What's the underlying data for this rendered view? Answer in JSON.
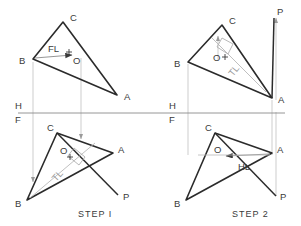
{
  "drawing": {
    "title": "Perpendicular to a Plane - Two Step Construction",
    "colors": {
      "object_line": "#2b2b2b",
      "construction_line": "#b0b0b0",
      "fold_line": "#8a8a8a",
      "label_text": "#3a3a3a",
      "tl_text": "#9a9a9a",
      "background": "#ffffff"
    },
    "fold_line": {
      "upper_label": "H",
      "lower_label": "F",
      "y": 113,
      "x_start": 18,
      "x_end": 285
    },
    "step_labels": [
      {
        "text": "STEP I",
        "x": 78,
        "y": 214
      },
      {
        "text": "STEP 2",
        "x": 232,
        "y": 214
      }
    ],
    "views": [
      {
        "id": "step1-top",
        "step": "STEP I",
        "view": "horizontal",
        "quadrant": "upper-left",
        "vertices": [
          {
            "label": "A",
            "x": 117,
            "y": 95,
            "label_x": 124,
            "label_y": 99
          },
          {
            "label": "B",
            "x": 33,
            "y": 59,
            "label_x": 21,
            "label_y": 63
          },
          {
            "label": "C",
            "x": 63,
            "y": 22,
            "label_x": 70,
            "label_y": 20
          }
        ],
        "point_o": {
          "label": "O",
          "x": 69,
          "y": 55,
          "label_x": 73,
          "label_y": 63
        },
        "annotation": {
          "text": "FL",
          "x": 52,
          "y": 52,
          "meaning": "frontal line"
        },
        "annotation_arrow": {
          "from_x": 33,
          "from_y": 59,
          "to_x": 69,
          "to_y": 55
        }
      },
      {
        "id": "step1-front",
        "step": "STEP I",
        "view": "frontal",
        "quadrant": "lower-left",
        "vertices": [
          {
            "label": "A",
            "x": 113,
            "y": 153,
            "label_x": 118,
            "label_y": 152
          },
          {
            "label": "B",
            "x": 27,
            "y": 200,
            "label_x": 17,
            "label_y": 205
          },
          {
            "label": "C",
            "x": 57,
            "y": 133,
            "label_x": 48,
            "label_y": 129
          },
          {
            "label": "P",
            "x": 118,
            "y": 195,
            "label_x": 124,
            "label_y": 198
          }
        ],
        "point_o": {
          "label": "O",
          "x": 70,
          "y": 157,
          "label_x": 62,
          "label_y": 153
        },
        "annotation": {
          "text": "TL",
          "x": 56,
          "y": 178,
          "meaning": "true length",
          "rotated": true
        },
        "right_angle_marker": {
          "x": 80,
          "y": 155
        }
      },
      {
        "id": "step2-top",
        "step": "STEP 2",
        "view": "horizontal",
        "quadrant": "upper-right",
        "vertices": [
          {
            "label": "A",
            "x": 272,
            "y": 98,
            "label_x": 278,
            "label_y": 102
          },
          {
            "label": "B",
            "x": 188,
            "y": 62,
            "label_x": 176,
            "label_y": 66
          },
          {
            "label": "C",
            "x": 222,
            "y": 25,
            "label_x": 229,
            "label_y": 23
          },
          {
            "label": "P",
            "x": 272,
            "y": 16,
            "label_x": 276,
            "label_y": 14
          }
        ],
        "point_o": {
          "label": "O",
          "x": 225,
          "y": 57,
          "label_x": 215,
          "label_y": 60
        },
        "annotation": {
          "text": "TL",
          "x": 235,
          "y": 72,
          "meaning": "true length",
          "rotated": true
        },
        "right_angle_marker": {
          "x": 228,
          "y": 46
        }
      },
      {
        "id": "step2-front",
        "step": "STEP 2",
        "view": "frontal",
        "quadrant": "lower-right",
        "vertices": [
          {
            "label": "A",
            "x": 272,
            "y": 153,
            "label_x": 278,
            "label_y": 152
          },
          {
            "label": "B",
            "x": 186,
            "y": 200,
            "label_x": 176,
            "label_y": 205
          },
          {
            "label": "C",
            "x": 215,
            "y": 133,
            "label_x": 206,
            "label_y": 129
          },
          {
            "label": "P",
            "x": 276,
            "y": 196,
            "label_x": 281,
            "label_y": 199
          }
        ],
        "point_o": {
          "label": "O",
          "x": 222,
          "y": 155,
          "label_x": 216,
          "label_y": 152
        },
        "annotation": {
          "text": "HL",
          "x": 243,
          "y": 166,
          "meaning": "horizontal line"
        },
        "annotation_arrow": {
          "from_x": 272,
          "from_y": 153,
          "to_x": 224,
          "to_y": 156
        }
      }
    ],
    "projectors": [
      {
        "name": "projector-b-left",
        "x": 33,
        "y1": 62,
        "y2": 182,
        "arrow": "down"
      },
      {
        "name": "projector-o-left",
        "x": 81,
        "y1": 58,
        "y2": 139,
        "arrow": "down"
      },
      {
        "name": "projector-b-right",
        "x": 188,
        "y1": 64,
        "y2": 155,
        "arrow": "none"
      },
      {
        "name": "projector-o-right",
        "x": 218,
        "y1": 36,
        "y2": 60,
        "arrow": "up"
      },
      {
        "name": "projector-a-right",
        "x": 272,
        "y1": 100,
        "y2": 155,
        "arrow": "none"
      },
      {
        "name": "projector-p-right",
        "x": 276,
        "y1": 18,
        "y2": 100,
        "arrow": "up"
      },
      {
        "name": "projector-p-far",
        "x": 276,
        "y1": 110,
        "y2": 196,
        "arrow": "none"
      }
    ]
  }
}
